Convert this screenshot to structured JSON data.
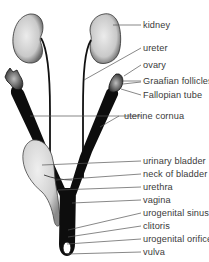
{
  "diagram": {
    "colors": {
      "organ_fill": "#d8d8d8",
      "organ_dark": "#0d0d0d",
      "leader_line": "#555555",
      "label_text": "#3a3a3a"
    },
    "labels": [
      {
        "text": "kidney",
        "y": 20
      },
      {
        "text": "ureter",
        "y": 43
      },
      {
        "text": "ovary",
        "y": 60
      },
      {
        "text": "Graafian follicles",
        "y": 76
      },
      {
        "text": "Fallopian tube",
        "y": 90
      },
      {
        "text": "uterine cornua",
        "y": 111
      },
      {
        "text": "urinary bladder",
        "y": 156
      },
      {
        "text": "neck of bladder",
        "y": 169
      },
      {
        "text": "urethra",
        "y": 182
      },
      {
        "text": "vagina",
        "y": 195
      },
      {
        "text": "urogenital sinus",
        "y": 208
      },
      {
        "text": "clitoris",
        "y": 221
      },
      {
        "text": "urogenital orifice",
        "y": 234
      },
      {
        "text": "vulva",
        "y": 247
      }
    ]
  }
}
